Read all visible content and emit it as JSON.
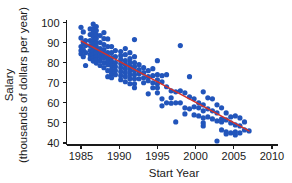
{
  "chart_data": {
    "type": "scatter",
    "title": "",
    "xlabel": "Start Year",
    "ylabel_line1": "Salary",
    "ylabel_line2": "(thousands of dollars per year)",
    "xlim": [
      1983.5,
      2011.0
    ],
    "ylim": [
      37.0,
      102.5
    ],
    "xticks": [
      1985,
      1990,
      1995,
      2000,
      2005,
      2010
    ],
    "xticklabels": [
      "1985",
      "1990",
      "1995",
      "2000",
      "2005",
      "2010"
    ],
    "yticks": [
      40,
      50,
      60,
      70,
      80,
      90,
      100
    ],
    "yticklabels": [
      "40",
      "50",
      "60",
      "70",
      "80",
      "90",
      "100"
    ],
    "grid": false,
    "legend": null,
    "marker_color": "#2255bb",
    "marker_size": 2.6,
    "trendline": {
      "name": "least-squares regression line",
      "color": "#d63027",
      "x_start": 1985.0,
      "y_start": 90.8,
      "x_end": 2007.0,
      "y_end": 46.0
    },
    "points": [
      [
        1985.0,
        97.6
      ],
      [
        1985.0,
        92.3
      ],
      [
        1985.0,
        88.0
      ],
      [
        1985.0,
        86.0
      ],
      [
        1985.0,
        84.4
      ],
      [
        1985.3,
        95.3
      ],
      [
        1985.3,
        90.0
      ],
      [
        1985.3,
        86.5
      ],
      [
        1985.3,
        83.0
      ],
      [
        1985.6,
        91.0
      ],
      [
        1985.6,
        88.6
      ],
      [
        1985.6,
        85.0
      ],
      [
        1985.6,
        78.6
      ],
      [
        1986.2,
        96.8
      ],
      [
        1986.2,
        94.0
      ],
      [
        1986.2,
        91.0
      ],
      [
        1986.2,
        88.5
      ],
      [
        1986.2,
        86.0
      ],
      [
        1986.2,
        84.0
      ],
      [
        1986.2,
        82.0
      ],
      [
        1986.6,
        99.2
      ],
      [
        1986.6,
        97.0
      ],
      [
        1986.6,
        95.0
      ],
      [
        1986.6,
        93.0
      ],
      [
        1986.6,
        91.0
      ],
      [
        1986.6,
        89.2
      ],
      [
        1986.6,
        87.4
      ],
      [
        1986.6,
        85.6
      ],
      [
        1986.6,
        84.0
      ],
      [
        1986.6,
        82.4
      ],
      [
        1986.6,
        80.8
      ],
      [
        1987.0,
        98.0
      ],
      [
        1987.0,
        96.0
      ],
      [
        1987.0,
        94.0
      ],
      [
        1987.0,
        92.0
      ],
      [
        1987.0,
        90.0
      ],
      [
        1987.0,
        88.0
      ],
      [
        1987.0,
        86.2
      ],
      [
        1987.0,
        84.6
      ],
      [
        1987.0,
        83.0
      ],
      [
        1987.0,
        81.4
      ],
      [
        1987.0,
        79.8
      ],
      [
        1987.5,
        93.5
      ],
      [
        1987.5,
        90.0
      ],
      [
        1987.5,
        87.0
      ],
      [
        1987.5,
        85.0
      ],
      [
        1987.5,
        83.0
      ],
      [
        1987.5,
        81.0
      ],
      [
        1987.5,
        78.6
      ],
      [
        1988.0,
        95.0
      ],
      [
        1988.0,
        92.0
      ],
      [
        1988.0,
        89.0
      ],
      [
        1988.0,
        86.5
      ],
      [
        1988.0,
        84.5
      ],
      [
        1988.0,
        82.5
      ],
      [
        1988.0,
        80.0
      ],
      [
        1988.0,
        77.5
      ],
      [
        1988.5,
        91.8
      ],
      [
        1988.5,
        88.0
      ],
      [
        1988.5,
        85.0
      ],
      [
        1988.5,
        83.0
      ],
      [
        1988.5,
        81.0
      ],
      [
        1988.5,
        79.0
      ],
      [
        1988.5,
        76.0
      ],
      [
        1988.5,
        73.0
      ],
      [
        1989.0,
        88.0
      ],
      [
        1989.0,
        85.0
      ],
      [
        1989.0,
        82.5
      ],
      [
        1989.0,
        80.5
      ],
      [
        1989.0,
        78.5
      ],
      [
        1989.0,
        76.5
      ],
      [
        1989.0,
        74.5
      ],
      [
        1989.0,
        72.5
      ],
      [
        1989.5,
        86.0
      ],
      [
        1989.5,
        83.0
      ],
      [
        1989.5,
        80.0
      ],
      [
        1989.5,
        78.0
      ],
      [
        1989.5,
        76.0
      ],
      [
        1989.5,
        74.0
      ],
      [
        1990.2,
        85.5
      ],
      [
        1990.2,
        83.5
      ],
      [
        1990.2,
        81.5
      ],
      [
        1990.2,
        79.5
      ],
      [
        1990.2,
        77.5
      ],
      [
        1990.2,
        75.5
      ],
      [
        1990.2,
        73.5
      ],
      [
        1990.2,
        71.5
      ],
      [
        1990.8,
        87.0
      ],
      [
        1990.8,
        84.0
      ],
      [
        1990.8,
        81.0
      ],
      [
        1990.8,
        79.0
      ],
      [
        1990.8,
        77.0
      ],
      [
        1990.8,
        75.0
      ],
      [
        1990.8,
        73.0
      ],
      [
        1990.8,
        70.5
      ],
      [
        1991.4,
        85.0
      ],
      [
        1991.4,
        82.0
      ],
      [
        1991.4,
        80.0
      ],
      [
        1991.4,
        78.0
      ],
      [
        1991.4,
        76.0
      ],
      [
        1991.4,
        74.0
      ],
      [
        1991.4,
        72.0
      ],
      [
        1991.4,
        69.5
      ],
      [
        1992.0,
        91.5
      ],
      [
        1992.0,
        83.0
      ],
      [
        1992.0,
        80.0
      ],
      [
        1992.0,
        78.0
      ],
      [
        1992.0,
        76.0
      ],
      [
        1992.0,
        74.0
      ],
      [
        1992.0,
        72.0
      ],
      [
        1992.0,
        69.5
      ],
      [
        1992.0,
        67.5
      ],
      [
        1992.6,
        79.0
      ],
      [
        1992.6,
        76.5
      ],
      [
        1992.6,
        74.5
      ],
      [
        1992.6,
        72.0
      ],
      [
        1993.2,
        77.5
      ],
      [
        1993.2,
        75.0
      ],
      [
        1993.2,
        72.5
      ],
      [
        1993.2,
        70.0
      ],
      [
        1993.8,
        76.0
      ],
      [
        1993.8,
        73.0
      ],
      [
        1993.8,
        71.0
      ],
      [
        1993.8,
        64.5
      ],
      [
        1994.4,
        77.0
      ],
      [
        1994.4,
        73.5
      ],
      [
        1994.4,
        70.0
      ],
      [
        1994.4,
        67.5
      ],
      [
        1995.0,
        81.0
      ],
      [
        1995.0,
        74.0
      ],
      [
        1995.0,
        71.5
      ],
      [
        1995.0,
        69.5
      ],
      [
        1995.0,
        67.5
      ],
      [
        1995.0,
        65.0
      ],
      [
        1995.6,
        73.5
      ],
      [
        1995.6,
        70.5
      ],
      [
        1995.6,
        62.0
      ],
      [
        1995.6,
        58.5
      ],
      [
        1996.2,
        74.0
      ],
      [
        1996.2,
        68.0
      ],
      [
        1996.2,
        60.0
      ],
      [
        1996.8,
        66.0
      ],
      [
        1996.8,
        62.5
      ],
      [
        1996.8,
        59.8
      ],
      [
        1997.4,
        65.5
      ],
      [
        1997.4,
        60.0
      ],
      [
        1997.4,
        50.5
      ],
      [
        1998.0,
        88.5
      ],
      [
        1998.0,
        66.0
      ],
      [
        1998.0,
        60.0
      ],
      [
        1998.6,
        65.0
      ],
      [
        1998.6,
        57.5
      ],
      [
        1998.6,
        54.5
      ],
      [
        1999.2,
        73.0
      ],
      [
        1999.2,
        63.0
      ],
      [
        1999.2,
        57.0
      ],
      [
        1999.8,
        62.0
      ],
      [
        1999.8,
        58.0
      ],
      [
        1999.8,
        54.0
      ],
      [
        2000.4,
        60.0
      ],
      [
        2000.4,
        57.5
      ],
      [
        2000.4,
        53.5
      ],
      [
        2001.0,
        65.5
      ],
      [
        2001.0,
        59.0
      ],
      [
        2001.0,
        56.0
      ],
      [
        2001.0,
        52.5
      ],
      [
        2001.0,
        50.0
      ],
      [
        2001.0,
        48.5
      ],
      [
        2001.6,
        62.5
      ],
      [
        2001.6,
        57.0
      ],
      [
        2001.6,
        53.0
      ],
      [
        2002.2,
        62.0
      ],
      [
        2002.2,
        56.0
      ],
      [
        2002.2,
        52.0
      ],
      [
        2002.8,
        59.0
      ],
      [
        2002.8,
        55.0
      ],
      [
        2002.8,
        51.0
      ],
      [
        2002.8,
        41.0
      ],
      [
        2003.4,
        57.5
      ],
      [
        2003.4,
        52.0
      ],
      [
        2003.4,
        50.5
      ],
      [
        2003.4,
        46.5
      ],
      [
        2004.0,
        55.0
      ],
      [
        2004.0,
        51.5
      ],
      [
        2004.0,
        45.5
      ],
      [
        2004.0,
        44.5
      ],
      [
        2004.6,
        53.0
      ],
      [
        2004.6,
        50.0
      ],
      [
        2004.6,
        45.0
      ],
      [
        2005.2,
        53.5
      ],
      [
        2005.2,
        49.0
      ],
      [
        2005.2,
        45.5
      ],
      [
        2005.2,
        44.0
      ],
      [
        2005.8,
        52.5
      ],
      [
        2005.8,
        48.5
      ],
      [
        2005.8,
        45.0
      ],
      [
        2006.4,
        50.5
      ],
      [
        2006.4,
        46.5
      ],
      [
        2007.0,
        46.0
      ]
    ]
  }
}
